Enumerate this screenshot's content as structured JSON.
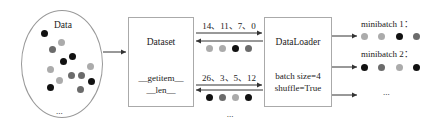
{
  "data_pool": {
    "title": "Data",
    "ellipsis": "...",
    "dots": [
      {
        "x": 44,
        "y": 33,
        "color": "black"
      },
      {
        "x": 61,
        "y": 42,
        "color": "light"
      },
      {
        "x": 52,
        "y": 49,
        "color": "dark"
      },
      {
        "x": 72,
        "y": 56,
        "color": "black"
      },
      {
        "x": 63,
        "y": 61,
        "color": "black"
      },
      {
        "x": 90,
        "y": 66,
        "color": "light"
      },
      {
        "x": 50,
        "y": 69,
        "color": "light"
      },
      {
        "x": 71,
        "y": 75,
        "color": "dark"
      },
      {
        "x": 81,
        "y": 75,
        "color": "dark"
      },
      {
        "x": 59,
        "y": 80,
        "color": "light"
      },
      {
        "x": 91,
        "y": 81,
        "color": "black"
      },
      {
        "x": 50,
        "y": 87,
        "color": "black"
      },
      {
        "x": 80,
        "y": 89,
        "color": "dark"
      }
    ]
  },
  "dataset": {
    "title": "Dataset",
    "method_1": "__getitem__",
    "method_2": "__len__"
  },
  "exchange": {
    "batch_1_indices": "14、11、7、0",
    "batch_1_dots": [
      "light",
      "light",
      "black",
      "dark"
    ],
    "batch_2_indices": "26、3、5、12",
    "batch_2_dots": [
      "black",
      "dark",
      "light",
      "black"
    ],
    "ellipsis": "..."
  },
  "dataloader": {
    "title": "DataLoader",
    "param_1": "batch size=4",
    "param_2": "shuffle=True"
  },
  "minibatches": {
    "items": [
      {
        "label": "minibatch 1：",
        "dots": [
          "light",
          "light",
          "black",
          "dark"
        ]
      },
      {
        "label": "minibatch 2：",
        "dots": [
          "black",
          "dark",
          "light",
          "black"
        ]
      }
    ],
    "ellipsis": "..."
  },
  "colors": {
    "black": "#111111",
    "dark": "#6b6b6b",
    "light": "#ababab",
    "line": "#333333"
  }
}
